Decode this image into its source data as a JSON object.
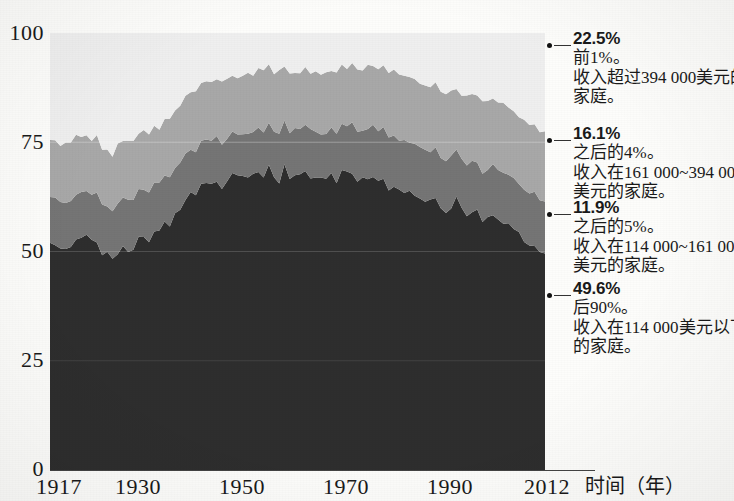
{
  "chart_data": {
    "type": "area",
    "stacked": true,
    "title": "",
    "subtitle": "",
    "xlabel": "时间（年）",
    "ylabel": "",
    "xlim": [
      1917,
      2012
    ],
    "ylim": [
      0,
      100
    ],
    "grid": false,
    "legend_position": "right-annotations",
    "x_ticks": [
      {
        "value": 1917,
        "label": "1917"
      },
      {
        "value": 1930,
        "label": "1930"
      },
      {
        "value": 1950,
        "label": "1950"
      },
      {
        "value": 1970,
        "label": "1970"
      },
      {
        "value": 1990,
        "label": "1990"
      },
      {
        "value": 2012,
        "label": "2012"
      }
    ],
    "y_ticks": [
      {
        "value": 0,
        "label": "0"
      },
      {
        "value": 25,
        "label": "25"
      },
      {
        "value": 50,
        "label": "50"
      },
      {
        "value": 75,
        "label": "75"
      },
      {
        "value": 100,
        "label": "100"
      }
    ],
    "series": [
      {
        "name": "后90%",
        "end_value": 49.6,
        "color": "#2e2e2e",
        "order": 1,
        "x": [
          1917,
          1920,
          1923,
          1926,
          1929,
          1932,
          1935,
          1938,
          1941,
          1944,
          1947,
          1950,
          1953,
          1956,
          1959,
          1962,
          1965,
          1968,
          1971,
          1974,
          1977,
          1980,
          1983,
          1986,
          1989,
          1992,
          1995,
          1998,
          2001,
          2004,
          2007,
          2010,
          2012
        ],
        "values": [
          52.0,
          50.5,
          53.0,
          51.0,
          48.5,
          50.0,
          53.0,
          54.5,
          57.0,
          63.5,
          65.0,
          66.5,
          67.0,
          67.5,
          67.5,
          67.5,
          67.5,
          67.5,
          67.0,
          67.5,
          66.5,
          67.0,
          65.0,
          63.0,
          61.5,
          61.0,
          60.0,
          58.5,
          57.5,
          56.5,
          54.0,
          51.0,
          49.6
        ]
      },
      {
        "name": "之后的5%",
        "end_value": 11.9,
        "color": "#757575",
        "order": 2,
        "x": [
          1917,
          1920,
          1923,
          1926,
          1929,
          1932,
          1935,
          1938,
          1941,
          1944,
          1947,
          1950,
          1953,
          1956,
          1959,
          1962,
          1965,
          1968,
          1971,
          1974,
          1977,
          1980,
          1983,
          1986,
          1989,
          1992,
          1995,
          1998,
          2001,
          2004,
          2007,
          2010,
          2012
        ],
        "values": [
          10.5,
          11.0,
          10.5,
          11.0,
          11.0,
          11.5,
          11.0,
          11.0,
          11.0,
          10.0,
          10.0,
          10.0,
          10.0,
          10.0,
          10.5,
          10.5,
          10.5,
          10.5,
          11.0,
          11.0,
          11.5,
          11.5,
          11.5,
          11.5,
          11.5,
          11.5,
          11.5,
          11.5,
          11.5,
          11.5,
          11.5,
          11.8,
          11.9
        ]
      },
      {
        "name": "之后的4%",
        "end_value": 16.1,
        "color": "#a8a8a8",
        "order": 3,
        "x": [
          1917,
          1920,
          1923,
          1926,
          1929,
          1932,
          1935,
          1938,
          1941,
          1944,
          1947,
          1950,
          1953,
          1956,
          1959,
          1962,
          1965,
          1968,
          1971,
          1974,
          1977,
          1980,
          1983,
          1986,
          1989,
          1992,
          1995,
          1998,
          2001,
          2004,
          2007,
          2010,
          2012
        ],
        "values": [
          13.0,
          13.5,
          13.0,
          13.0,
          13.0,
          13.5,
          13.0,
          13.0,
          13.5,
          13.5,
          13.5,
          13.5,
          13.5,
          13.5,
          13.5,
          13.5,
          13.5,
          13.5,
          13.5,
          13.5,
          14.0,
          14.0,
          14.5,
          15.0,
          15.0,
          15.0,
          15.0,
          15.5,
          15.5,
          15.5,
          15.5,
          16.0,
          16.1
        ]
      },
      {
        "name": "前1%",
        "end_value": 22.5,
        "color": "#efefef",
        "order": 4,
        "x": [
          1917,
          1920,
          1923,
          1926,
          1929,
          1932,
          1935,
          1938,
          1941,
          1944,
          1947,
          1950,
          1953,
          1956,
          1959,
          1962,
          1965,
          1968,
          1971,
          1974,
          1977,
          1980,
          1983,
          1986,
          1989,
          1992,
          1995,
          1998,
          2001,
          2004,
          2007,
          2010,
          2012
        ],
        "values": [
          24.5,
          25.0,
          23.5,
          25.0,
          27.5,
          25.0,
          23.0,
          21.5,
          18.5,
          13.0,
          11.5,
          10.0,
          9.5,
          9.0,
          8.5,
          8.5,
          8.5,
          8.5,
          8.5,
          8.0,
          8.0,
          7.5,
          9.0,
          10.5,
          12.0,
          12.5,
          13.5,
          14.5,
          15.5,
          16.5,
          19.0,
          21.2,
          22.5
        ]
      }
    ]
  },
  "axis": {
    "y_labels": [
      "100",
      "75",
      "50",
      "25",
      "0"
    ],
    "x_labels": [
      "1917",
      "1930",
      "1950",
      "1970",
      "1990",
      "2012"
    ],
    "x_title": "时间（年）"
  },
  "annotations": [
    {
      "pct": "22.5%",
      "line2": "前1%。",
      "line3": "收入超过394 000美元的",
      "line4": "家庭。"
    },
    {
      "pct": "16.1%",
      "line2": "之后的4%。",
      "line3": "收入在161 000~394 000",
      "line4": "美元的家庭。"
    },
    {
      "pct": "11.9%",
      "line2": "之后的5%。",
      "line3": "收入在114 000~161 000",
      "line4": "美元的家庭。"
    },
    {
      "pct": "49.6%",
      "line2": "后90%。",
      "line3": "收入在114 000美元以下",
      "line4": "的家庭。"
    }
  ]
}
